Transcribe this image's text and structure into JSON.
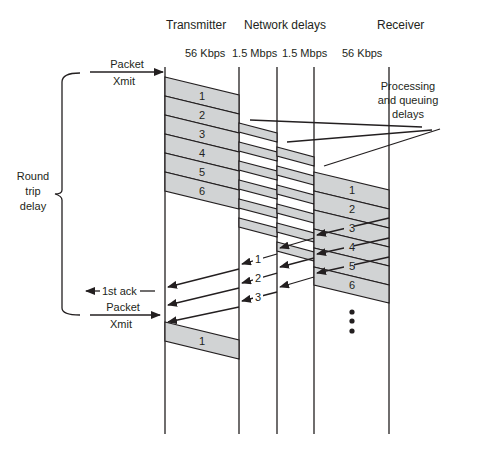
{
  "headers": {
    "transmitter": "Transmitter",
    "network_delays": "Network delays",
    "receiver": "Receiver"
  },
  "link_speeds": [
    "56 Kbps",
    "1.5 Mbps",
    "1.5 Mbps",
    "56 Kbps"
  ],
  "labels": {
    "packet_xmit_top_line1": "Packet",
    "packet_xmit_top_line2": "Xmit",
    "packet_xmit_bottom_line1": "Packet",
    "packet_xmit_bottom_line2": "Xmit",
    "first_ack": "1st ack",
    "round_trip_line1": "Round",
    "round_trip_line2": "trip",
    "round_trip_line3": "delay",
    "processing_line1": "Processing",
    "processing_line2": "and queuing",
    "processing_line3": "delays"
  },
  "transmitter_packets": [
    "1",
    "2",
    "3",
    "4",
    "5",
    "6"
  ],
  "receiver_packets": [
    "1",
    "2",
    "3",
    "4",
    "5",
    "6"
  ],
  "receiver_acks": [
    "3",
    "4",
    "5"
  ],
  "network_acks": [
    "1",
    "2",
    "3"
  ],
  "retransmit_packet": "1",
  "colors": {
    "packet_fill": "#d1d3d4",
    "line": "#231f20"
  }
}
